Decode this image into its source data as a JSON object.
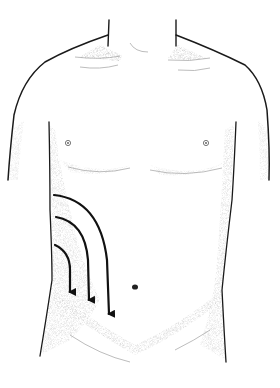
{
  "figure": {
    "background": "#ffffff",
    "line_color": "#1a1a1a",
    "shade_color": "#9a9a9a",
    "arrow_color": "#111111"
  },
  "landmarks": {
    "nipples": [
      {
        "x": 68,
        "y": 143
      },
      {
        "x": 206,
        "y": 143
      }
    ],
    "navel": {
      "x": 135,
      "y": 287
    }
  },
  "arrows": [
    {
      "name": "inner-arrow",
      "start": [
        55,
        245
      ],
      "end": [
        70,
        296
      ]
    },
    {
      "name": "middle-arrow",
      "start": [
        56,
        217
      ],
      "end": [
        89,
        304
      ]
    },
    {
      "name": "outer-arrow",
      "start": [
        54,
        195
      ],
      "end": [
        109,
        318
      ]
    }
  ]
}
